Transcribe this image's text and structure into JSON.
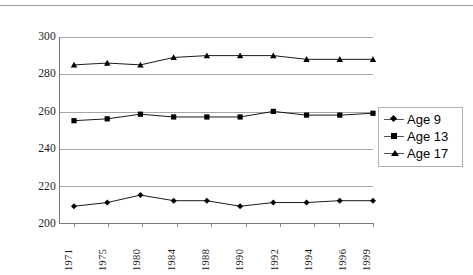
{
  "chart_data": {
    "type": "line",
    "title": "",
    "subtitle": "",
    "xlabel": "",
    "ylabel": "",
    "categories": [
      "1971",
      "1975",
      "1980",
      "1984",
      "1988",
      "1990",
      "1992",
      "1994",
      "1996",
      "1999"
    ],
    "ylim": [
      200,
      300
    ],
    "yticks": [
      200,
      220,
      240,
      260,
      280,
      300
    ],
    "ytick_labels": [
      "200",
      "220",
      "240",
      "260",
      "280",
      "300"
    ],
    "grid": true,
    "legend_position": "right",
    "series": [
      {
        "name": "Age 9",
        "marker": "diamond",
        "color": "#000000",
        "values": [
          209,
          211,
          215,
          212,
          212,
          209,
          211,
          211,
          212,
          212
        ]
      },
      {
        "name": "Age 13",
        "marker": "square",
        "color": "#000000",
        "values": [
          255,
          256,
          258.5,
          257,
          257,
          257,
          260,
          258,
          258,
          259
        ]
      },
      {
        "name": "Age 17",
        "marker": "triangle",
        "color": "#000000",
        "values": [
          285,
          286,
          285,
          289,
          290,
          290,
          290,
          288,
          288,
          288
        ]
      }
    ],
    "annotations": []
  },
  "legend": {
    "entries": [
      {
        "label": "Age 9"
      },
      {
        "label": "Age 13"
      },
      {
        "label": "Age 17"
      }
    ]
  }
}
